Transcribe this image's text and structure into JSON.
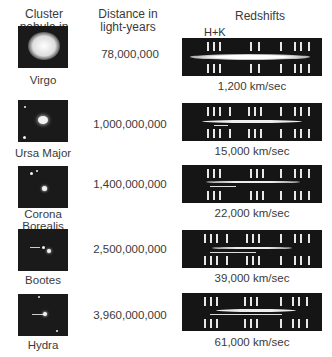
{
  "headers": {
    "cluster": "Cluster nebula in",
    "distance": "Distance in light-years",
    "redshifts": "Redshifts"
  },
  "hk_label": "H+K",
  "rows": [
    {
      "name": "Virgo",
      "distance": "78,000,000",
      "velocity": "1,200 km/sec"
    },
    {
      "name": "Ursa Major",
      "distance": "1,000,000,000",
      "velocity": "15,000 km/sec"
    },
    {
      "name": "Corona Borealis",
      "distance": "1,400,000,000",
      "velocity": "22,000 km/sec"
    },
    {
      "name": "Bootes",
      "distance": "2,500,000,000",
      "velocity": "39,000 km/sec"
    },
    {
      "name": "Hydra",
      "distance": "3,960,000,000",
      "velocity": "61,000 km/sec"
    }
  ],
  "colors": {
    "background": "#ffffff",
    "panel": "#151515",
    "text": "#3a3a3a"
  }
}
